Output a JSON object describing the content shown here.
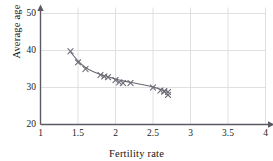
{
  "chart_data": {
    "type": "scatter",
    "title": "",
    "xlabel": "Fertility rate",
    "ylabel": "Average age",
    "xlim": [
      1,
      4
    ],
    "ylim": [
      20,
      50
    ],
    "xticks": [
      "1",
      "1.5",
      "2",
      "2.5",
      "3",
      "3.5",
      "4"
    ],
    "xtick_values": [
      1,
      1.5,
      2,
      2.5,
      3,
      3.5,
      4
    ],
    "yticks": [
      "20",
      "30",
      "40",
      "50"
    ],
    "ytick_values": [
      20,
      30,
      40,
      50
    ],
    "grid": true,
    "grid_color": "#d8d8d8",
    "legend": "none",
    "marker": "x",
    "marker_color": "#6e6e78",
    "trend_line": {
      "present": true,
      "style": "smooth decreasing curve",
      "color": "#6a6a74"
    },
    "x": [
      1.4,
      1.5,
      1.6,
      1.8,
      1.85,
      1.9,
      2.0,
      2.05,
      2.1,
      2.2,
      2.5,
      2.6,
      2.65,
      2.65,
      2.7,
      2.7
    ],
    "y": [
      39.8,
      36.8,
      35.0,
      33.4,
      33.0,
      32.8,
      32.0,
      31.4,
      31.2,
      31.2,
      30.0,
      29.2,
      28.9,
      29.0,
      28.8,
      28.0
    ],
    "points": [
      {
        "x": 1.4,
        "y": 39.8
      },
      {
        "x": 1.5,
        "y": 36.8
      },
      {
        "x": 1.6,
        "y": 35.0
      },
      {
        "x": 1.8,
        "y": 33.4
      },
      {
        "x": 1.85,
        "y": 33.0
      },
      {
        "x": 1.9,
        "y": 32.8
      },
      {
        "x": 2.0,
        "y": 32.0
      },
      {
        "x": 2.05,
        "y": 31.4
      },
      {
        "x": 2.1,
        "y": 31.2
      },
      {
        "x": 2.2,
        "y": 31.2
      },
      {
        "x": 2.5,
        "y": 30.0
      },
      {
        "x": 2.6,
        "y": 29.2
      },
      {
        "x": 2.65,
        "y": 28.9
      },
      {
        "x": 2.65,
        "y": 29.0
      },
      {
        "x": 2.7,
        "y": 28.8
      },
      {
        "x": 2.7,
        "y": 28.0
      }
    ],
    "curve": [
      {
        "x": 1.4,
        "y": 39.6
      },
      {
        "x": 1.5,
        "y": 37.2
      },
      {
        "x": 1.6,
        "y": 35.4
      },
      {
        "x": 1.7,
        "y": 34.3
      },
      {
        "x": 1.8,
        "y": 33.5
      },
      {
        "x": 1.9,
        "y": 32.9
      },
      {
        "x": 2.0,
        "y": 32.3
      },
      {
        "x": 2.1,
        "y": 31.8
      },
      {
        "x": 2.2,
        "y": 31.4
      },
      {
        "x": 2.3,
        "y": 31.0
      },
      {
        "x": 2.4,
        "y": 30.6
      },
      {
        "x": 2.5,
        "y": 30.1
      },
      {
        "x": 2.6,
        "y": 29.5
      },
      {
        "x": 2.7,
        "y": 28.9
      }
    ]
  },
  "axes": {
    "x_title": "Fertility rate",
    "y_title": "Average age",
    "x_tick_labels": [
      "1",
      "1.5",
      "2",
      "2.5",
      "3",
      "3.5",
      "4"
    ],
    "y_tick_labels": [
      "20",
      "30",
      "40",
      "50"
    ]
  }
}
